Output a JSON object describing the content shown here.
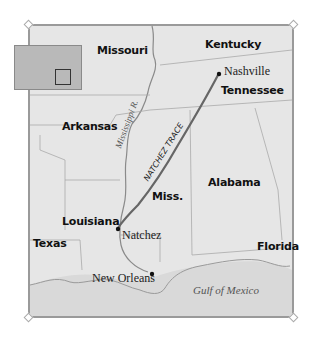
{
  "map": {
    "title": "Natchez Trace",
    "states": [
      {
        "label": "Missouri"
      },
      {
        "label": "Kentucky"
      },
      {
        "label": "Tennessee"
      },
      {
        "label": "Arkansas"
      },
      {
        "label": "Miss."
      },
      {
        "label": "Alabama"
      },
      {
        "label": "Louisiana"
      },
      {
        "label": "Texas"
      },
      {
        "label": "Florida"
      }
    ],
    "cities": [
      {
        "label": "Nashville"
      },
      {
        "label": "Natchez"
      },
      {
        "label": "New Orleans"
      }
    ],
    "route": {
      "label": "NATCHEZ TRACE",
      "color": "#666666"
    },
    "river": {
      "label": "Mississippi R."
    },
    "water_body": {
      "label": "Gulf of Mexico"
    },
    "inset": {
      "description": "United States locator map",
      "highlight": "map area"
    },
    "colors": {
      "land": "#e6e6e6",
      "water": "#d8d8d8",
      "borders": "#9a9a9a",
      "frame": "#9a9a9a"
    }
  }
}
